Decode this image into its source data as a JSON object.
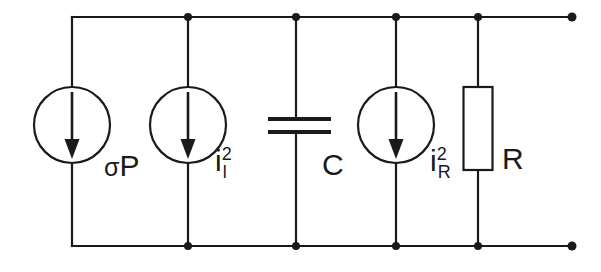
{
  "figure": {
    "kind": "electrical-circuit-schematic",
    "background_color": "#ffffff",
    "line_color": "#1a1a1a"
  },
  "labels": {
    "source_sigma_p": {
      "symbol": "σ",
      "base": "P"
    },
    "source_i_leak": {
      "base": "i",
      "superscript": "2",
      "subscript": "l"
    },
    "capacitor": {
      "base": "C"
    },
    "source_i_r": {
      "base": "i",
      "superscript": "2",
      "subscript": "R"
    },
    "resistor": {
      "base": "R"
    }
  },
  "components": [
    {
      "name": "current-source-sigma-p",
      "type": "current-source",
      "label": "σP",
      "direction": "down"
    },
    {
      "name": "current-source-i-leak",
      "type": "current-source",
      "label": "i²ₗ",
      "direction": "down"
    },
    {
      "name": "capacitor-c",
      "type": "capacitor",
      "label": "C"
    },
    {
      "name": "current-source-i-r",
      "type": "current-source",
      "label": "i²ᴿ",
      "direction": "down"
    },
    {
      "name": "resistor-r",
      "type": "resistor",
      "label": "R"
    }
  ],
  "nodes": {
    "top_rail_y": 17,
    "bottom_rail_y": 246,
    "branch_x": [
      72,
      188,
      296,
      396,
      478
    ],
    "terminal_x": 572
  }
}
